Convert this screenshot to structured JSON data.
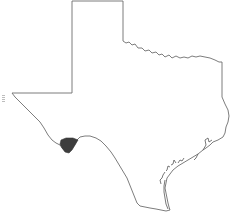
{
  "map": {
    "region": "Texas",
    "highlighted_county": {
      "fill": "#3d3d3d",
      "location": "southwest border (Big Bend area)"
    },
    "outline_color": "#6e6e6e",
    "background": "#ffffff"
  }
}
